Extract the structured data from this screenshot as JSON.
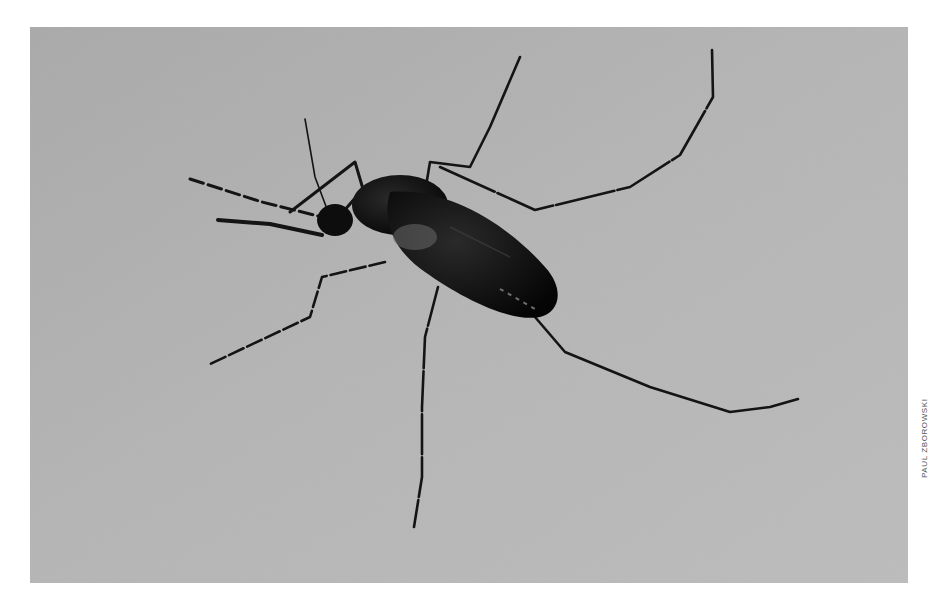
{
  "photo": {
    "subject": "mosquito resting on human skin",
    "style": "black-and-white photograph",
    "background_color": "#b4b4b4",
    "subject_color": "#111111"
  },
  "credit": {
    "text": "PAUL ZBOROWSKI"
  }
}
